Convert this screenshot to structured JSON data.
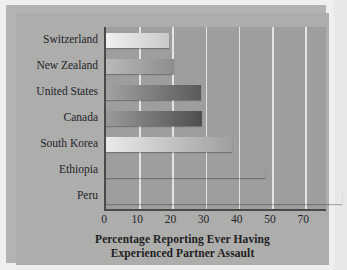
{
  "chart_data": {
    "type": "bar",
    "orientation": "horizontal",
    "title": "",
    "xlabel_lines": [
      "Percentage Reporting Ever Having",
      "Experienced Partner Assault"
    ],
    "xlabel": "Percentage Reporting Ever Having Experienced Partner Assault",
    "ylabel": "",
    "categories": [
      "Switzerland",
      "New Zealand",
      "United States",
      "Canada",
      "South Korea",
      "Ethiopia",
      "Peru"
    ],
    "values": [
      19,
      20.5,
      28.5,
      29,
      38,
      48,
      71
    ],
    "xticks": [
      0,
      10,
      20,
      30,
      40,
      50,
      70
    ],
    "xtick_labels": [
      "0",
      "10",
      "20",
      "30",
      "40",
      "50",
      "70"
    ],
    "xlim": [
      0,
      77
    ],
    "grid": "vertical-white",
    "legend": "none",
    "palette": "grayscale-gradient",
    "bar_gradients": [
      {
        "from": "#f1f1ef",
        "to": "#c9c9c7"
      },
      {
        "from": "#b9b9b7",
        "to": "#8d8d8b"
      },
      {
        "from": "#a2a2a0",
        "to": "#5a5a58"
      },
      {
        "from": "#9a9a98",
        "to": "#4e4e4c"
      },
      {
        "from": "#eaeae8",
        "to": "#9f9f9d"
      },
      {
        "from": "#c6c6c4",
        "to": "#77777 5"
      },
      {
        "from": "#d8d8d6",
        "to": "#85858 3"
      }
    ]
  },
  "colors": {
    "figure_background": "#efefee",
    "panel_background": "#adadab",
    "plot_background": "#9e9e9c",
    "gridline": "#e4e4e2",
    "axis": "#4a4a48",
    "text": "#24242a"
  }
}
